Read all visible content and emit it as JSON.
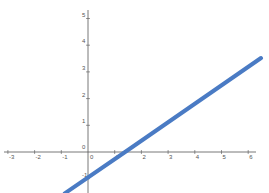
{
  "title": "",
  "colors": {
    "axis": "#555555",
    "line": "#4a7bc4",
    "grid_label": "#555555",
    "background": "#ffffff"
  },
  "chart_data": {
    "type": "line",
    "title": "",
    "xlabel": "",
    "ylabel": "",
    "x_ticks": [
      -3,
      -2,
      -1,
      0,
      1,
      2,
      3,
      4,
      5,
      6
    ],
    "y_ticks": [
      -1,
      0,
      1,
      2,
      3,
      4,
      5
    ],
    "xlim": [
      -3.3,
      6.3
    ],
    "ylim": [
      -1.55,
      5.3
    ],
    "grid": false,
    "series": [
      {
        "name": "line",
        "equation": "y = 0.7x - 1",
        "x": [
          -0.87,
          1.39,
          6.48
        ],
        "y": [
          -1.55,
          0,
          3.52
        ]
      }
    ]
  },
  "axes": {
    "origin_px": [
      88,
      152
    ],
    "unit_px": 26.7
  }
}
